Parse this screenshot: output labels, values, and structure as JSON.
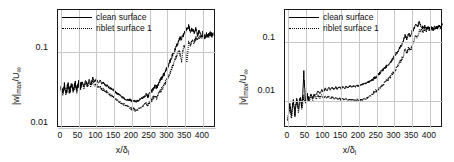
{
  "figure": {
    "panels": [
      {
        "id": "left",
        "ylabel": "|w|max/U∞",
        "ylabel_parts": {
          "base": "|w|",
          "sub": "max",
          "tail": "/U",
          "tail_sub": "∞"
        },
        "xlabel": "x/δi",
        "legend": [
          {
            "label": "clean surface",
            "style": "solid"
          },
          {
            "label": "riblet surface 1",
            "style": "dotted"
          }
        ]
      },
      {
        "id": "right",
        "ylabel": "|v|max/U∞",
        "ylabel_parts": {
          "base": "|v|",
          "sub": "max",
          "tail": "/U",
          "tail_sub": "∞"
        },
        "xlabel": "x/δi",
        "legend": [
          {
            "label": "clean surface",
            "style": "solid"
          },
          {
            "label": "riblet surface 1",
            "style": "dotted"
          }
        ]
      }
    ]
  },
  "chart_data": [
    {
      "type": "line",
      "title": "",
      "xlabel": "x/δi",
      "ylabel": "|w|max/U∞",
      "yscale": "log",
      "xlim": [
        -8,
        437
      ],
      "ylim": [
        0.01,
        0.35
      ],
      "xticks": [
        0,
        50,
        100,
        150,
        200,
        250,
        300,
        350,
        400
      ],
      "yticks": [
        0.01,
        0.1
      ],
      "ytick_labels": [
        "0.01",
        "0.1"
      ],
      "grid": true,
      "legend_position": "top-center",
      "series": [
        {
          "name": "clean surface",
          "style": "solid",
          "color": "#000000",
          "x": [
            0,
            5,
            10,
            15,
            20,
            25,
            30,
            35,
            40,
            45,
            50,
            55,
            60,
            65,
            70,
            75,
            80,
            85,
            90,
            95,
            100,
            105,
            110,
            115,
            120,
            125,
            130,
            135,
            140,
            145,
            150,
            155,
            160,
            165,
            170,
            175,
            180,
            185,
            190,
            195,
            200,
            205,
            210,
            215,
            220,
            225,
            230,
            235,
            240,
            245,
            250,
            255,
            260,
            265,
            270,
            275,
            280,
            285,
            290,
            295,
            300,
            305,
            310,
            315,
            320,
            325,
            330,
            335,
            340,
            345,
            350,
            355,
            360,
            365,
            370,
            375,
            380,
            385,
            390,
            395,
            400,
            405,
            410,
            415,
            420,
            425,
            430,
            435
          ],
          "y": [
            0.034,
            0.03,
            0.036,
            0.029,
            0.037,
            0.03,
            0.038,
            0.031,
            0.039,
            0.032,
            0.04,
            0.034,
            0.041,
            0.035,
            0.042,
            0.036,
            0.043,
            0.038,
            0.045,
            0.04,
            0.044,
            0.039,
            0.042,
            0.038,
            0.039,
            0.036,
            0.036,
            0.034,
            0.033,
            0.032,
            0.031,
            0.029,
            0.028,
            0.027,
            0.026,
            0.025,
            0.024,
            0.0235,
            0.023,
            0.0235,
            0.0225,
            0.023,
            0.022,
            0.0225,
            0.023,
            0.024,
            0.0245,
            0.026,
            0.027,
            0.026,
            0.028,
            0.03,
            0.032,
            0.035,
            0.034,
            0.038,
            0.042,
            0.046,
            0.05,
            0.056,
            0.062,
            0.07,
            0.08,
            0.09,
            0.1,
            0.115,
            0.13,
            0.15,
            0.145,
            0.165,
            0.18,
            0.2,
            0.215,
            0.185,
            0.2,
            0.175,
            0.195,
            0.165,
            0.185,
            0.16,
            0.175,
            0.155,
            0.17,
            0.16,
            0.18,
            0.165,
            0.175
          ]
        },
        {
          "name": "riblet surface 1",
          "style": "dotted",
          "color": "#000000",
          "x": [
            0,
            5,
            10,
            15,
            20,
            25,
            30,
            35,
            40,
            45,
            50,
            55,
            60,
            65,
            70,
            75,
            80,
            85,
            90,
            95,
            100,
            105,
            110,
            115,
            120,
            125,
            130,
            135,
            140,
            145,
            150,
            155,
            160,
            165,
            170,
            175,
            180,
            185,
            190,
            195,
            200,
            205,
            210,
            215,
            220,
            225,
            230,
            235,
            240,
            245,
            250,
            255,
            260,
            265,
            270,
            275,
            280,
            285,
            290,
            295,
            300,
            305,
            310,
            315,
            320,
            325,
            330,
            335,
            340,
            345,
            350,
            355,
            360,
            365,
            370,
            375,
            380,
            385,
            390,
            395,
            400,
            405,
            410,
            415,
            420,
            425,
            430,
            435
          ],
          "y": [
            0.033,
            0.029,
            0.035,
            0.028,
            0.036,
            0.029,
            0.037,
            0.03,
            0.038,
            0.031,
            0.038,
            0.032,
            0.039,
            0.033,
            0.04,
            0.034,
            0.04,
            0.035,
            0.041,
            0.036,
            0.038,
            0.034,
            0.035,
            0.032,
            0.032,
            0.03,
            0.03,
            0.028,
            0.027,
            0.026,
            0.025,
            0.024,
            0.023,
            0.022,
            0.021,
            0.0205,
            0.02,
            0.0195,
            0.019,
            0.0185,
            0.0175,
            0.018,
            0.017,
            0.0175,
            0.018,
            0.0185,
            0.019,
            0.02,
            0.021,
            0.02,
            0.022,
            0.023,
            0.025,
            0.026,
            0.025,
            0.028,
            0.03,
            0.033,
            0.036,
            0.04,
            0.044,
            0.05,
            0.056,
            0.065,
            0.075,
            0.085,
            0.1,
            0.095,
            0.075,
            0.11,
            0.12,
            0.07,
            0.13,
            0.12,
            0.145,
            0.13,
            0.15,
            0.14,
            0.16,
            0.15,
            0.165,
            0.15,
            0.16,
            0.155,
            0.17,
            0.16,
            0.17
          ]
        }
      ]
    },
    {
      "type": "line",
      "title": "",
      "xlabel": "x/δi",
      "ylabel": "|v|max/U∞",
      "yscale": "log",
      "xlim": [
        -8,
        437
      ],
      "ylim": [
        0.0035,
        0.35
      ],
      "xticks": [
        0,
        50,
        100,
        150,
        200,
        250,
        300,
        350,
        400
      ],
      "yticks": [
        0.01,
        0.1
      ],
      "ytick_labels": [
        "0.01",
        "0.1"
      ],
      "grid": true,
      "legend_position": "top-center",
      "series": [
        {
          "name": "clean surface",
          "style": "solid",
          "color": "#000000",
          "x": [
            0,
            5,
            10,
            15,
            20,
            25,
            30,
            35,
            40,
            45,
            50,
            55,
            60,
            65,
            70,
            75,
            80,
            85,
            90,
            95,
            100,
            105,
            110,
            115,
            120,
            125,
            130,
            135,
            140,
            145,
            150,
            155,
            160,
            165,
            170,
            175,
            180,
            185,
            190,
            195,
            200,
            205,
            210,
            215,
            220,
            225,
            230,
            235,
            240,
            245,
            250,
            255,
            260,
            265,
            270,
            275,
            280,
            285,
            290,
            295,
            300,
            305,
            310,
            315,
            320,
            325,
            330,
            335,
            340,
            345,
            350,
            355,
            360,
            365,
            370,
            375,
            380,
            385,
            390,
            395,
            400,
            405,
            410,
            415,
            420,
            425,
            430,
            435
          ],
          "y": [
            0.005,
            0.009,
            0.0055,
            0.0105,
            0.006,
            0.0115,
            0.007,
            0.012,
            0.008,
            0.03,
            0.0095,
            0.0125,
            0.0105,
            0.013,
            0.0115,
            0.0135,
            0.0125,
            0.015,
            0.0135,
            0.0155,
            0.0145,
            0.0165,
            0.015,
            0.017,
            0.0155,
            0.017,
            0.0158,
            0.0172,
            0.016,
            0.0175,
            0.0162,
            0.0175,
            0.0165,
            0.0178,
            0.0168,
            0.018,
            0.0172,
            0.0182,
            0.0175,
            0.0185,
            0.018,
            0.019,
            0.019,
            0.02,
            0.02,
            0.021,
            0.0215,
            0.0225,
            0.0235,
            0.025,
            0.026,
            0.028,
            0.03,
            0.032,
            0.0345,
            0.037,
            0.04,
            0.043,
            0.047,
            0.052,
            0.057,
            0.064,
            0.07,
            0.08,
            0.09,
            0.105,
            0.13,
            0.115,
            0.14,
            0.125,
            0.15,
            0.17,
            0.2,
            0.18,
            0.22,
            0.19,
            0.175,
            0.185,
            0.17,
            0.18,
            0.165,
            0.175,
            0.17,
            0.18,
            0.175,
            0.19,
            0.18,
            0.2
          ]
        },
        {
          "name": "riblet surface 1",
          "style": "dotted",
          "color": "#000000",
          "x": [
            0,
            5,
            10,
            15,
            20,
            25,
            30,
            35,
            40,
            45,
            50,
            55,
            60,
            65,
            70,
            75,
            80,
            85,
            90,
            95,
            100,
            105,
            110,
            115,
            120,
            125,
            130,
            135,
            140,
            145,
            150,
            155,
            160,
            165,
            170,
            175,
            180,
            185,
            190,
            195,
            200,
            205,
            210,
            215,
            220,
            225,
            230,
            235,
            240,
            245,
            250,
            255,
            260,
            265,
            270,
            275,
            280,
            285,
            290,
            295,
            300,
            305,
            310,
            315,
            320,
            325,
            330,
            335,
            340,
            345,
            350,
            355,
            360,
            365,
            370,
            375,
            380,
            385,
            390,
            395,
            400,
            405,
            410,
            415,
            420,
            425,
            430,
            435
          ],
          "y": [
            0.0048,
            0.0085,
            0.0052,
            0.01,
            0.0058,
            0.011,
            0.0065,
            0.0115,
            0.0075,
            0.012,
            0.009,
            0.0118,
            0.0098,
            0.0122,
            0.0105,
            0.0125,
            0.011,
            0.0128,
            0.0112,
            0.0125,
            0.0115,
            0.0122,
            0.0112,
            0.012,
            0.011,
            0.0118,
            0.0108,
            0.0115,
            0.0106,
            0.0112,
            0.0105,
            0.011,
            0.0104,
            0.0108,
            0.0103,
            0.0107,
            0.0102,
            0.0106,
            0.0102,
            0.0105,
            0.0102,
            0.0106,
            0.0104,
            0.0108,
            0.0108,
            0.0115,
            0.012,
            0.0128,
            0.0135,
            0.0145,
            0.015,
            0.016,
            0.017,
            0.0185,
            0.0195,
            0.021,
            0.0225,
            0.0245,
            0.0265,
            0.029,
            0.032,
            0.036,
            0.04,
            0.045,
            0.051,
            0.058,
            0.075,
            0.065,
            0.08,
            0.07,
            0.085,
            0.1,
            0.13,
            0.115,
            0.15,
            0.16,
            0.15,
            0.165,
            0.155,
            0.17,
            0.16,
            0.17,
            0.165,
            0.175,
            0.17,
            0.185,
            0.175,
            0.195
          ]
        }
      ]
    }
  ],
  "colors": {
    "axis": "#1a1a1a",
    "grid": "#c8c8c8",
    "series": "#000000",
    "background": "#ffffff"
  }
}
